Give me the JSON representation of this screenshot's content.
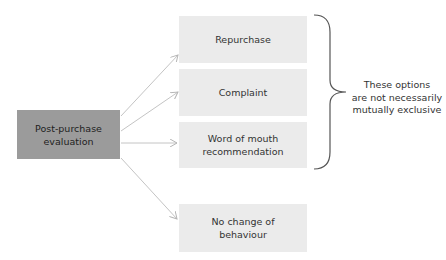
{
  "diagram": {
    "source": {
      "label_line1": "Post-purchase",
      "label_line2": "evaluation"
    },
    "options": [
      {
        "label_line1": "Repurchase",
        "label_line2": ""
      },
      {
        "label_line1": "Complaint",
        "label_line2": ""
      },
      {
        "label_line1": "Word of mouth",
        "label_line2": "recommendation"
      },
      {
        "label_line1": "No change of",
        "label_line2": "behaviour"
      }
    ],
    "brace_note": {
      "line1": "These options",
      "line2": "are not necessarily",
      "line3": "mutually exclusive"
    },
    "colors": {
      "source_fill": "#9b9b9b",
      "option_fill": "#ebebeb",
      "connector": "#bdbdbd",
      "brace": "#555555"
    }
  }
}
